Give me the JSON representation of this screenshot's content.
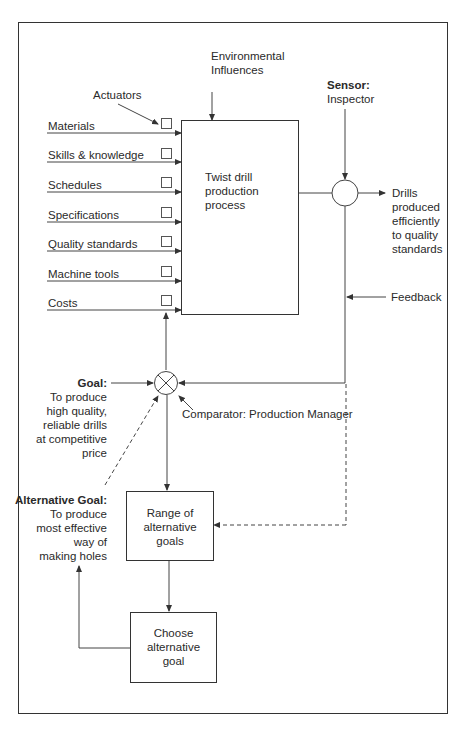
{
  "diagram": {
    "labels": {
      "actuators": "Actuators",
      "environmental": [
        "Environmental",
        "Influences"
      ],
      "sensor_title": "Sensor:",
      "sensor_name": "Inspector",
      "output": [
        "Drills",
        "produced",
        "efficiently",
        "to quality",
        "standards"
      ],
      "feedback": "Feedback",
      "goal_title": "Goal:",
      "goal_text": [
        "To produce",
        "high quality,",
        "reliable drills",
        "at competitive",
        "price"
      ],
      "comparator": "Comparator: Production Manager",
      "alt_goal_title": "Alternative Goal:",
      "alt_goal_text": [
        "To produce",
        "most effective",
        "way of",
        "making holes"
      ]
    },
    "inputs": [
      {
        "label": "Materials"
      },
      {
        "label": "Skills & knowledge"
      },
      {
        "label": "Schedules"
      },
      {
        "label": "Specifications"
      },
      {
        "label": "Quality standards"
      },
      {
        "label": "Machine tools"
      },
      {
        "label": "Costs"
      }
    ],
    "boxes": {
      "process": [
        "Twist drill",
        "production",
        "process"
      ],
      "range": [
        "Range of",
        "alternative",
        "goals"
      ],
      "choose": [
        "Choose",
        "alternative",
        "goal"
      ]
    },
    "nodes": [
      {
        "id": "process",
        "type": "box"
      },
      {
        "id": "sensor",
        "type": "circle"
      },
      {
        "id": "comparator",
        "type": "circle-x"
      },
      {
        "id": "range",
        "type": "box"
      },
      {
        "id": "choose",
        "type": "box"
      }
    ],
    "edges": [
      {
        "from": "inputs",
        "to": "process"
      },
      {
        "from": "environmental",
        "to": "process"
      },
      {
        "from": "process",
        "to": "sensor"
      },
      {
        "from": "sensor",
        "to": "output"
      },
      {
        "from": "sensor",
        "to": "comparator",
        "label": "Feedback"
      },
      {
        "from": "goal",
        "to": "comparator"
      },
      {
        "from": "comparator",
        "to": "actuators"
      },
      {
        "from": "comparator",
        "to": "range"
      },
      {
        "from": "sensor",
        "to": "range",
        "style": "dashed"
      },
      {
        "from": "range",
        "to": "choose"
      },
      {
        "from": "choose",
        "to": "alternative-goal"
      },
      {
        "from": "alternative-goal",
        "to": "comparator",
        "style": "dashed"
      }
    ]
  }
}
